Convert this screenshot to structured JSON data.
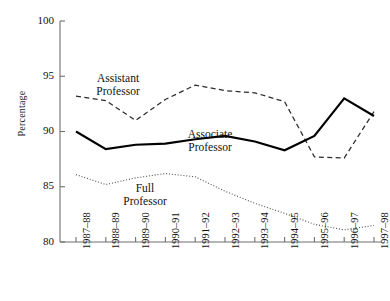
{
  "chart_data": {
    "type": "line",
    "title": "",
    "xlabel": "",
    "ylabel": "Percentage",
    "ylim": [
      80,
      100
    ],
    "yticks": [
      80,
      85,
      90,
      95,
      100
    ],
    "ytick_labels": [
      "80",
      "85",
      "90",
      "95",
      "100"
    ],
    "grid": false,
    "legend": "inline-labels",
    "categories": [
      "1987–88",
      "1988–89",
      "1989–90",
      "1990–91",
      "1991–92",
      "1992–93",
      "1993–94",
      "1994–95",
      "1995–96",
      "1996–97",
      "1997–98"
    ],
    "series": [
      {
        "name": "Assistant Professor",
        "style": "dashed",
        "color": "#2b2b2b",
        "values": [
          93.2,
          92.8,
          91.0,
          92.9,
          94.2,
          93.7,
          93.5,
          92.7,
          87.7,
          87.6,
          91.8
        ],
        "label_text": "Assistant\nProfessor",
        "label_x": 118,
        "label_y": 72
      },
      {
        "name": "Associate Professor",
        "style": "solid",
        "color": "#000000",
        "values": [
          90.0,
          88.4,
          88.8,
          88.9,
          89.3,
          89.6,
          89.1,
          88.3,
          89.6,
          93.0,
          91.4
        ],
        "label_text": "Associate\nProfessor",
        "label_x": 210,
        "label_y": 128
      },
      {
        "name": "Full Professor",
        "style": "dotted",
        "color": "#555555",
        "values": [
          86.1,
          85.2,
          85.8,
          86.2,
          85.9,
          84.6,
          83.5,
          82.6,
          81.6,
          81.1,
          81.5
        ],
        "label_text": "Full\nProfessor",
        "label_x": 145,
        "label_y": 182
      }
    ]
  },
  "geometry": {
    "plot_left": 60,
    "plot_right": 382,
    "plot_top": 21,
    "plot_bottom": 242,
    "x_first": 76,
    "x_step": 29.8
  }
}
